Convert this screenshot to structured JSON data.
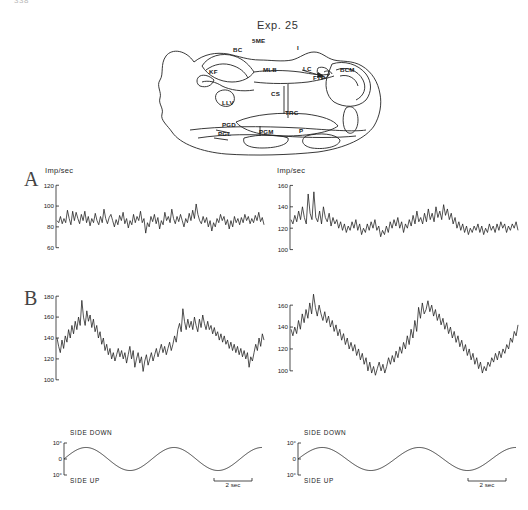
{
  "page": {
    "number": "338",
    "title": "Exp. 25",
    "background": "#ffffff",
    "trace_color": "#1a1a1a"
  },
  "brain_diagram": {
    "name": "brainstem-cross-section",
    "labels": [
      {
        "text": "5ME",
        "x": 252,
        "y": 43
      },
      {
        "text": "BC",
        "x": 233,
        "y": 52
      },
      {
        "text": "KF",
        "x": 209,
        "y": 74
      },
      {
        "text": "MLB",
        "x": 263,
        "y": 72
      },
      {
        "text": "I",
        "x": 297,
        "y": 50
      },
      {
        "text": "LC",
        "x": 303,
        "y": 71
      },
      {
        "text": "FTP",
        "x": 313,
        "y": 80
      },
      {
        "text": "BCM",
        "x": 340,
        "y": 72
      },
      {
        "text": "CS",
        "x": 271,
        "y": 96
      },
      {
        "text": "LLV",
        "x": 222,
        "y": 105
      },
      {
        "text": "TRC",
        "x": 285,
        "y": 115
      },
      {
        "text": "PGD",
        "x": 222,
        "y": 127
      },
      {
        "text": "PGL",
        "x": 218,
        "y": 136
      },
      {
        "text": "PGM",
        "x": 259,
        "y": 134
      },
      {
        "text": "P",
        "x": 299,
        "y": 133
      }
    ]
  },
  "panels": {
    "A": {
      "letter": "A",
      "left": {
        "name": "panel-a-left-trace",
        "y_axis_caption": "Imp/sec",
        "y_ticks": [
          120,
          100,
          80,
          60
        ],
        "y_min": 52,
        "y_max": 126,
        "mean_rate": 87,
        "modulated": false
      },
      "right": {
        "name": "panel-a-right-trace",
        "y_axis_caption": "Imp/sec",
        "y_ticks": [
          160,
          140,
          120,
          100
        ],
        "y_min": 94,
        "y_max": 166,
        "mean_rate": 128,
        "modulated": false
      }
    },
    "B": {
      "letter": "B",
      "left": {
        "name": "panel-b-left-trace",
        "y_ticks": [
          180,
          160,
          140,
          120,
          100
        ],
        "y_min": 96,
        "y_max": 184,
        "mean_rate": 140,
        "modulated": true
      },
      "right": {
        "name": "panel-b-right-trace",
        "y_ticks": [
          160,
          140,
          120,
          100
        ],
        "y_min": 88,
        "y_max": 172,
        "mean_rate": 130,
        "modulated": true
      }
    }
  },
  "tilt_traces": {
    "left": {
      "name": "tilt-trace-left",
      "label_top": "SIDE DOWN",
      "label_bottom": "SIDE UP",
      "tick_top": "10°",
      "tick_mid": "0",
      "tick_bottom": "10°",
      "scale_bar": "2 sec",
      "cycles": 2.25,
      "amplitude_deg": 8
    },
    "right": {
      "name": "tilt-trace-right",
      "label_top": "SIDE DOWN",
      "label_bottom": "SIDE UP",
      "tick_top": "10°",
      "tick_mid": "0",
      "tick_bottom": "10°",
      "scale_bar": "2 sec",
      "cycles": 2.25,
      "amplitude_deg": 8
    }
  },
  "chart_data": {
    "type": "line",
    "title": "Exp. 25",
    "ylabel": "Imp/sec",
    "xlabel": "time (2 sec scale bar)",
    "grid": false,
    "legend": "none",
    "charts": [
      {
        "name": "A-left",
        "ylim": [
          52,
          126
        ],
        "yticks": [
          60,
          80,
          100,
          120
        ],
        "values": [
          86,
          84,
          90,
          83,
          88,
          84,
          96,
          88,
          82,
          95,
          86,
          94,
          88,
          83,
          92,
          86,
          95,
          84,
          90,
          81,
          88,
          84,
          93,
          86,
          82,
          90,
          84,
          97,
          88,
          83,
          89,
          92,
          86,
          80,
          87,
          82,
          91,
          86,
          94,
          83,
          88,
          79,
          86,
          82,
          92,
          84,
          90,
          86,
          95,
          84,
          88,
          74,
          84,
          80,
          90,
          85,
          92,
          83,
          89,
          78,
          86,
          82,
          94,
          86,
          90,
          84,
          97,
          88,
          83,
          90,
          85,
          92,
          86,
          80,
          88,
          84,
          93,
          86,
          96,
          88,
          102,
          92,
          86,
          83,
          90,
          84,
          89,
          80,
          86,
          76,
          84,
          80,
          88,
          84,
          92,
          86,
          90,
          82,
          87,
          78,
          86,
          80,
          90,
          84,
          88,
          82,
          89,
          84,
          92,
          86,
          90,
          83,
          88,
          84,
          91,
          86,
          94,
          85,
          89,
          82
        ]
      },
      {
        "name": "A-right",
        "ylim": [
          94,
          166
        ],
        "yticks": [
          100,
          120,
          140,
          160
        ],
        "values": [
          128,
          124,
          132,
          126,
          136,
          128,
          140,
          130,
          124,
          152,
          134,
          128,
          154,
          130,
          126,
          136,
          124,
          140,
          130,
          126,
          134,
          122,
          130,
          124,
          128,
          120,
          126,
          118,
          124,
          116,
          122,
          118,
          126,
          120,
          128,
          118,
          124,
          114,
          120,
          116,
          124,
          118,
          126,
          120,
          128,
          118,
          122,
          112,
          118,
          114,
          122,
          116,
          126,
          120,
          128,
          122,
          130,
          120,
          126,
          116,
          124,
          120,
          128,
          122,
          132,
          124,
          136,
          126,
          130,
          124,
          134,
          126,
          138,
          128,
          134,
          126,
          140,
          130,
          136,
          128,
          142,
          132,
          138,
          128,
          134,
          124,
          130,
          120,
          126,
          118,
          124,
          116,
          122,
          114,
          120,
          116,
          122,
          118,
          124,
          116,
          122,
          114,
          120,
          116,
          124,
          118,
          122,
          116,
          124,
          118,
          126,
          120,
          124,
          116,
          122,
          118,
          124,
          120,
          126,
          118
        ]
      },
      {
        "name": "B-left",
        "ylim": [
          96,
          184
        ],
        "yticks": [
          100,
          120,
          140,
          160,
          180
        ],
        "values": [
          140,
          132,
          126,
          138,
          130,
          142,
          136,
          148,
          140,
          152,
          144,
          156,
          148,
          160,
          152,
          176,
          160,
          152,
          166,
          156,
          162,
          150,
          158,
          146,
          152,
          140,
          146,
          134,
          140,
          128,
          134,
          124,
          130,
          120,
          126,
          118,
          124,
          130,
          122,
          128,
          120,
          126,
          116,
          124,
          132,
          120,
          128,
          112,
          120,
          126,
          116,
          122,
          108,
          118,
          124,
          114,
          120,
          126,
          118,
          124,
          130,
          122,
          128,
          134,
          126,
          132,
          124,
          130,
          136,
          128,
          134,
          142,
          136,
          148,
          154,
          146,
          168,
          156,
          148,
          158,
          150,
          156,
          148,
          160,
          152,
          146,
          158,
          150,
          162,
          154,
          148,
          156,
          148,
          152,
          144,
          150,
          142,
          146,
          138,
          144,
          136,
          142,
          134,
          138,
          130,
          136,
          128,
          134,
          126,
          132,
          124,
          130,
          122,
          128,
          120,
          126,
          112,
          122,
          118,
          126,
          134,
          128,
          140,
          132,
          144,
          138
        ]
      },
      {
        "name": "B-right",
        "ylim": [
          88,
          172
        ],
        "yticks": [
          100,
          120,
          140,
          160,
          180
        ],
        "values": [
          138,
          132,
          140,
          134,
          146,
          138,
          152,
          144,
          156,
          148,
          162,
          152,
          170,
          158,
          150,
          160,
          152,
          146,
          154,
          144,
          150,
          140,
          146,
          136,
          142,
          132,
          138,
          128,
          134,
          124,
          130,
          120,
          126,
          118,
          124,
          114,
          120,
          110,
          116,
          106,
          112,
          100,
          108,
          98,
          104,
          96,
          102,
          108,
          100,
          106,
          98,
          104,
          112,
          106,
          114,
          108,
          118,
          112,
          122,
          116,
          126,
          120,
          132,
          124,
          138,
          130,
          146,
          136,
          158,
          148,
          162,
          152,
          156,
          164,
          154,
          160,
          150,
          156,
          146,
          152,
          142,
          148,
          138,
          144,
          134,
          140,
          130,
          136,
          126,
          132,
          122,
          128,
          118,
          124,
          114,
          120,
          110,
          116,
          106,
          112,
          102,
          108,
          98,
          104,
          100,
          108,
          104,
          112,
          108,
          116,
          110,
          118,
          112,
          120,
          116,
          124,
          120,
          130,
          126,
          136,
          132,
          142
        ]
      }
    ]
  }
}
